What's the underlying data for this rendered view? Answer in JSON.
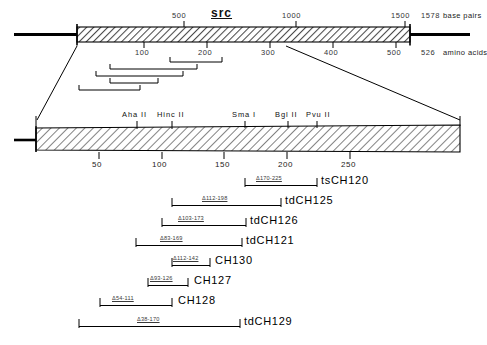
{
  "figure": {
    "gene_label": "src",
    "top_axis": {
      "unit_top": "base pairs",
      "unit_bottom": "amino acids",
      "bp_ticks": [
        "500",
        "1000",
        "1500"
      ],
      "bp_end_label": "1578",
      "aa_ticks": [
        "100",
        "200",
        "300",
        "400",
        "500"
      ],
      "aa_end_label": "526"
    },
    "expanded_axis": {
      "ticks": [
        "50",
        "100",
        "150",
        "200",
        "250"
      ]
    },
    "restriction_sites": [
      {
        "name": "Aha II"
      },
      {
        "name": "Hinc II"
      },
      {
        "name": "Sma I"
      },
      {
        "name": "Bgl II"
      },
      {
        "name": "Pvu II"
      }
    ],
    "constructs": [
      {
        "name": "tsCH120",
        "deletion": "Δ170-225"
      },
      {
        "name": "tdCH125",
        "deletion": "Δ112-198"
      },
      {
        "name": "tdCH126",
        "deletion": "Δ103-173"
      },
      {
        "name": "tdCH121",
        "deletion": "Δ83-169"
      },
      {
        "name": "CH130",
        "deletion": "Δ112-142"
      },
      {
        "name": "CH127",
        "deletion": "Δ93-126"
      },
      {
        "name": "CH128",
        "deletion": "Δ54-111"
      },
      {
        "name": "tdCH129",
        "deletion": "Δ38-170"
      }
    ]
  }
}
